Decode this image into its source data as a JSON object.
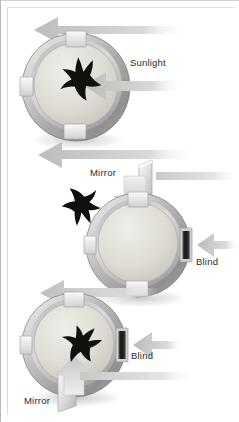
{
  "figure": {
    "width": 239,
    "height": 422,
    "background": "#ffffff",
    "border_color": "#b8b8b8"
  },
  "labels": {
    "sunlight": "Sunlight",
    "mirror_panel2": "Mirror",
    "blind_panel2": "Blind",
    "blind_panel3": "Blind",
    "mirror_panel3": "Mirror"
  },
  "panels": [
    {
      "id": "panel-1",
      "name": "top-apparatus",
      "bird_heading": "up-left",
      "light_source": "Sunlight",
      "light_direction": "from-right",
      "outgoing_arrows": [
        "top-left",
        "bottom-left"
      ],
      "mirror": null,
      "blind": null
    },
    {
      "id": "panel-2",
      "name": "middle-apparatus",
      "bird_heading": "down-left",
      "light_source": "Mirror",
      "light_direction": "from-top",
      "outgoing_arrows": [
        "bottom-left"
      ],
      "mirror": "Mirror",
      "blind": "Blind"
    },
    {
      "id": "panel-3",
      "name": "bottom-apparatus",
      "bird_heading": "up-right",
      "light_source": "Mirror",
      "light_direction": "from-bottom",
      "outgoing_arrows": [
        "right"
      ],
      "mirror": "Mirror",
      "blind": "Blind"
    }
  ],
  "colors": {
    "bird": "#101010",
    "ring_light": "#e8e8e8",
    "ring_mid": "#bdbdbd",
    "ring_dark": "#8e8e8e",
    "cage_floor": "#dcdcd6",
    "arrow_light": "#dcdcdc",
    "arrow_mid": "#c4c4c4",
    "blind_dark": "#1a1a1a",
    "text": "#2b2b2b"
  }
}
